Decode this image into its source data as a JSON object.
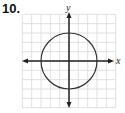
{
  "problem_number": "10.",
  "chart_data": {
    "type": "line",
    "title": "",
    "xlabel": "x",
    "ylabel": "y",
    "xlim": [
      -5,
      5
    ],
    "ylim": [
      -5,
      5
    ],
    "grid": true,
    "series": [
      {
        "name": "circle",
        "shape": "circle",
        "center": [
          0,
          0
        ],
        "radius": 3
      }
    ]
  },
  "colors": {
    "grid": "#d8d8d8",
    "axis": "#222222",
    "curve": "#333333"
  }
}
